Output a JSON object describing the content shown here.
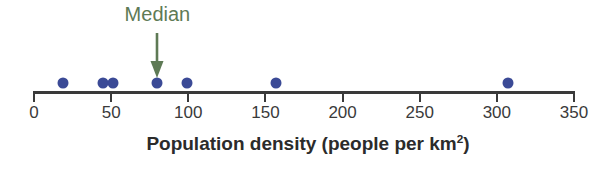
{
  "chart_data": {
    "type": "scatter",
    "title": "",
    "xlabel": "Population density (people per km²)",
    "xlabel_main": "Population density (people per km",
    "xlabel_sup": "2",
    "xlabel_tail": ")",
    "ylabel": "",
    "xlim": [
      0,
      350
    ],
    "grid": false,
    "legend": "none",
    "tick_labels": [
      "0",
      "50",
      "100",
      "150",
      "200",
      "250",
      "300",
      "350"
    ],
    "ticks": [
      0,
      50,
      100,
      150,
      200,
      250,
      300,
      350
    ],
    "x": [
      19,
      45,
      51,
      80,
      99,
      157,
      307
    ],
    "y": [
      0,
      0,
      0,
      0,
      0,
      0,
      0
    ],
    "point_color": "#3b4a96",
    "axis_color": "#3a3a3a",
    "annotations": [
      {
        "text": "Median",
        "value": 80,
        "color": "#5e7a55",
        "marker": "down-arrow"
      }
    ]
  },
  "axis": {
    "title_main": "Population density (people per km",
    "title_sup": "2",
    "title_tail": ")"
  },
  "annotation": {
    "median_label": "Median"
  },
  "colors": {
    "dot": "#3b4a96",
    "axis": "#3a3a3a",
    "annotation": "#5e7a55",
    "text": "#2b2b2b"
  }
}
